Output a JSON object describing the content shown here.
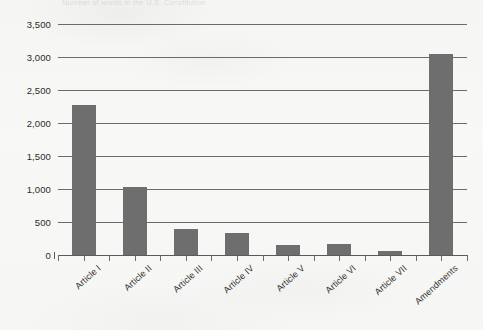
{
  "chart_data": {
    "type": "bar",
    "title": "Number of words in the U.S. Constitution",
    "xlabel": "",
    "ylabel": "",
    "categories": [
      "Article I",
      "Article II",
      "Article III",
      "Article IV",
      "Article V",
      "Article VI",
      "Article VII",
      "Amendments"
    ],
    "values": [
      2270,
      1030,
      390,
      340,
      150,
      165,
      55,
      3050
    ],
    "ylim": [
      0,
      3500
    ],
    "y_tick_values": [
      0,
      500,
      1000,
      1500,
      2000,
      2500,
      3000,
      3500
    ],
    "y_tick_labels": [
      "0",
      "500",
      "1,000",
      "1,500",
      "2,000",
      "2,500",
      "3,000",
      "3,500"
    ],
    "grid": true,
    "legend": false,
    "legend_position": "none",
    "bar_color": "#6e6e6e",
    "axis_color": "#6b6b6b",
    "background_color": "#f7f7f5",
    "label_rotation_degrees": -42
  }
}
